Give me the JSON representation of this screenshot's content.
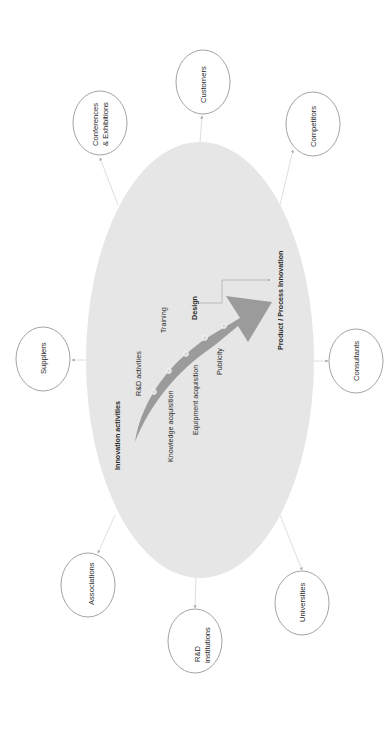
{
  "diagram": {
    "orientation": "rotated -90deg (text reads bottom-to-top)",
    "colors": {
      "background": "#ffffff",
      "central_ellipse_fill": "#e6e6e6",
      "arrow_fill": "#9b9b9b",
      "node_stroke": "#8c8c8c",
      "connector": "#d0d0d0",
      "text": "#2a2a2a"
    },
    "center": {
      "title": "Innovation activities",
      "activities": [
        "R&D activities",
        "Knowledge acquisition",
        "Training",
        "Equipment acquisition",
        "Design",
        "Publicity"
      ],
      "outcome": "Product / Process Innovation"
    },
    "external_sources": [
      {
        "id": "conferences",
        "line1": "Conferences",
        "line2": "& Exhibitions"
      },
      {
        "id": "customers",
        "line1": "Customers",
        "line2": ""
      },
      {
        "id": "competitors",
        "line1": "Competitors",
        "line2": ""
      },
      {
        "id": "suppliers",
        "line1": "Suppliers",
        "line2": ""
      },
      {
        "id": "consultants",
        "line1": "Consultants",
        "line2": ""
      },
      {
        "id": "associations",
        "line1": "Associations",
        "line2": ""
      },
      {
        "id": "rd_institutions",
        "line1": "R&D",
        "line2": "institutions"
      },
      {
        "id": "universities",
        "line1": "Universities",
        "line2": ""
      }
    ]
  }
}
